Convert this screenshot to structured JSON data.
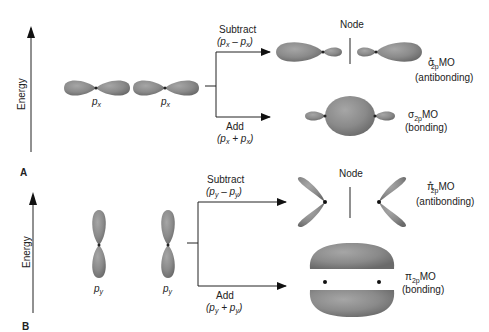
{
  "panels": [
    {
      "id": "A",
      "label": "A",
      "axis_label": "Energy",
      "atomic_orbitals": [
        "p",
        "p"
      ],
      "atomic_sub": "x",
      "subtract_label": "Subtract",
      "subtract_expr": {
        "open": "(",
        "p1": "p",
        "s1": "x",
        "minus": " – ",
        "p2": "p",
        "s2": "x",
        "close": ")"
      },
      "add_label": "Add",
      "add_expr": {
        "open": "(",
        "p1": "p",
        "s1": "x",
        "plus": " + ",
        "p2": "p",
        "s2": "x",
        "close": ")"
      },
      "node_label": "Node",
      "antibonding": {
        "symbol": "σ",
        "sup": "*",
        "sub": "2p",
        "mo": "MO",
        "desc": "(antibonding)"
      },
      "bonding": {
        "symbol": "σ",
        "sub": "2p",
        "mo": "MO",
        "desc": "(bonding)"
      }
    },
    {
      "id": "B",
      "label": "B",
      "axis_label": "Energy",
      "atomic_orbitals": [
        "p",
        "p"
      ],
      "atomic_sub": "y",
      "subtract_label": "Subtract",
      "subtract_expr": {
        "open": "(",
        "p1": "p",
        "s1": "y",
        "minus": " – ",
        "p2": "p",
        "s2": "y",
        "close": ")"
      },
      "add_label": "Add",
      "add_expr": {
        "open": "(",
        "p1": "p",
        "s1": "y",
        "plus": " + ",
        "p2": "p",
        "s2": "y",
        "close": ")"
      },
      "node_label": "Node",
      "antibonding": {
        "symbol": "π",
        "sup": "*",
        "sub": "2p",
        "mo": "MO",
        "desc": "(antibonding)"
      },
      "bonding": {
        "symbol": "π",
        "sub": "2p",
        "mo": "MO",
        "desc": "(bonding)"
      }
    }
  ],
  "colors": {
    "lobe": "#8a8a8a",
    "lobe_dark": "#6b6b6b",
    "line": "#222222"
  }
}
